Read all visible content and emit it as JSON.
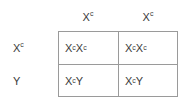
{
  "figure": {
    "type": "punnett-square",
    "rows": 2,
    "columns": 2,
    "line_color": "#9a9a9a",
    "text_color": "#3a3a3a",
    "background_color": "#ffffff"
  },
  "column_headers": [
    {
      "base": "X",
      "superscript": "c"
    },
    {
      "base": "X",
      "superscript": "c"
    }
  ],
  "row_labels": [
    {
      "base": "X",
      "superscript": "c"
    },
    {
      "base": "Y",
      "superscript": ""
    }
  ],
  "cells": [
    [
      {
        "allele1_base": "X",
        "allele1_sup": "c",
        "allele2_base": "X",
        "allele2_sup": "c"
      },
      {
        "allele1_base": "X",
        "allele1_sup": "c",
        "allele2_base": "X",
        "allele2_sup": "c"
      }
    ],
    [
      {
        "allele1_base": "X",
        "allele1_sup": "c",
        "allele2_base": "Y",
        "allele2_sup": ""
      },
      {
        "allele1_base": "X",
        "allele1_sup": "c",
        "allele2_base": "Y",
        "allele2_sup": ""
      }
    ]
  ]
}
